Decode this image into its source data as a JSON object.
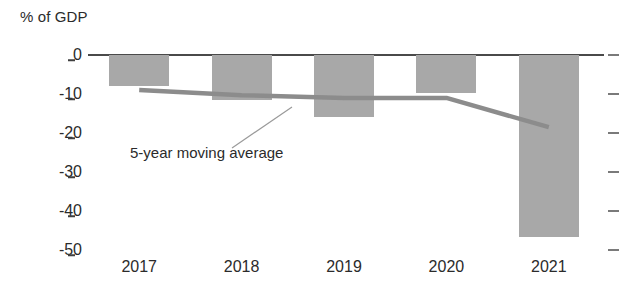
{
  "chart_data": {
    "type": "bar",
    "title": "",
    "subtitle": "",
    "xlabel": "",
    "ylabel": "% of GDP",
    "categories": [
      "2017",
      "2018",
      "2019",
      "2020",
      "2021"
    ],
    "values": [
      -8,
      -11.5,
      -16,
      -9.7,
      -46.7
    ],
    "ylim": [
      -50,
      0
    ],
    "ytick_labels": [
      "0",
      "-10",
      "-20",
      "-30",
      "-40",
      "-50"
    ],
    "ytick_values": [
      0,
      -10,
      -20,
      -30,
      -40,
      -50
    ],
    "grid": false,
    "legend_position": "none",
    "bar_color": "#a8a8a8",
    "series": [
      {
        "name": "5-year moving average",
        "type": "line",
        "color": "#8c8c8c",
        "x": [
          "2017",
          "2018",
          "2019",
          "2020",
          "2021"
        ],
        "values": [
          -9,
          -10.3,
          -11,
          -11,
          -18.5
        ]
      }
    ],
    "annotations": [
      {
        "text": "5-year moving average",
        "target_x": "2018",
        "target_y": -11
      }
    ]
  },
  "axis": {
    "y_title": "% of GDP"
  },
  "ticks": {
    "y": [
      {
        "label": "0"
      },
      {
        "label": "-10"
      },
      {
        "label": "-20"
      },
      {
        "label": "-30"
      },
      {
        "label": "-40"
      },
      {
        "label": "-50"
      }
    ],
    "x": [
      {
        "label": "2017"
      },
      {
        "label": "2018"
      },
      {
        "label": "2019"
      },
      {
        "label": "2020"
      },
      {
        "label": "2021"
      }
    ]
  },
  "annotation": {
    "moving_average_label": "5-year moving average"
  },
  "colors": {
    "bar": "#a8a8a8",
    "line": "#8c8c8c",
    "axis": "#4a4a4a",
    "text": "#2b2b2b"
  }
}
